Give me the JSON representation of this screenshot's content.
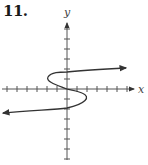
{
  "problem_number": "11.",
  "chart_data": {
    "type": "line",
    "title": "11.",
    "xlabel": "x",
    "ylabel": "y",
    "xlim": [
      -6.5,
      7
    ],
    "ylim": [
      -7,
      7
    ],
    "grid": false,
    "x_ticks": [
      -6,
      -5,
      -4,
      -3,
      -2,
      -1,
      1,
      2,
      3,
      4,
      5,
      6
    ],
    "y_ticks": [
      -7,
      -6,
      -5,
      -4,
      -3,
      -2,
      -1,
      1,
      2,
      3,
      4,
      5,
      6
    ],
    "tick_labels_shown": false,
    "series": [
      {
        "name": "S-curve (x as cubic in y)",
        "points": [
          {
            "x": -6.5,
            "y": -2.5
          },
          {
            "x": 0,
            "y": -1.9
          },
          {
            "x": 1.9,
            "y": -0.9
          },
          {
            "x": 0,
            "y": 0
          },
          {
            "x": -1.9,
            "y": 1.1
          },
          {
            "x": 0,
            "y": 1.7
          },
          {
            "x": 6.1,
            "y": 2.1
          }
        ],
        "arrows": [
          "left-end",
          "right-end"
        ]
      }
    ],
    "colors": {
      "axis": "#333333",
      "curve": "#333333",
      "text": "#1a1a1a"
    }
  }
}
